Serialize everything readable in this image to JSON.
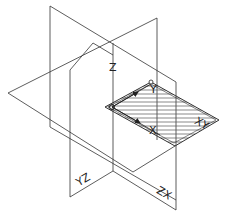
{
  "figure": {
    "axes": {
      "x_label": "X",
      "y_label": "Y",
      "z_label": "Z"
    },
    "planes": {
      "xy_label": "XY",
      "yz_label": "YZ",
      "zx_label": "ZX"
    },
    "colors": {
      "line": "#333333",
      "hatch": "#555555",
      "background": "#ffffff"
    }
  }
}
